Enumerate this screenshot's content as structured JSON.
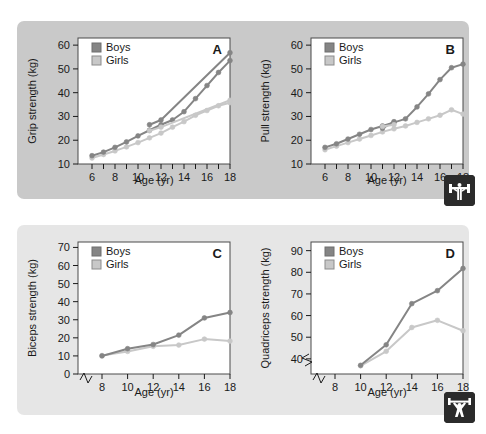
{
  "figure": {
    "name": "muscle-strength-by-age-and-sex",
    "background_top": "#c9c9c9",
    "background_bottom": "#e6e6e6",
    "series_colors": {
      "boys": "#858585",
      "girls": "#c8c8c8"
    }
  },
  "legend": {
    "boys_label": "Boys",
    "girls_label": "Girls"
  },
  "icons": {
    "pull_badge": "bench-press-icon",
    "lift_badge": "weightlifter-icon"
  },
  "chart_data": [
    {
      "id": "A",
      "type": "line",
      "panel_letter": "A",
      "title": "",
      "xlabel": "Age (yr)",
      "ylabel": "Grip strength (kg)",
      "xlim": [
        6,
        18
      ],
      "ylim": [
        10,
        63
      ],
      "yticks": [
        10,
        20,
        30,
        40,
        50,
        60
      ],
      "xticks": [
        6,
        7,
        8,
        9,
        10,
        11,
        12,
        13,
        14,
        15,
        16,
        17,
        18
      ],
      "xtick_labels": [
        "6",
        "",
        "8",
        "",
        "10",
        "",
        "12",
        "",
        "14",
        "",
        "16",
        "",
        "18"
      ],
      "axis_break_x": false,
      "grid": false,
      "legend_position": "top-left",
      "x": [
        6,
        7,
        8,
        9,
        10,
        11,
        12,
        13,
        14,
        15,
        16,
        17,
        18
      ],
      "series": [
        {
          "name": "Boys",
          "values": [
            13.5,
            15.0,
            17.0,
            19.3,
            21.8,
            24.2,
            26.5,
            28.5,
            32.0,
            37.5,
            43.0,
            48.5,
            53.5
          ]
        },
        {
          "name": "Girls",
          "values": [
            12.5,
            14.0,
            15.5,
            17.2,
            19.0,
            21.0,
            23.0,
            25.5,
            27.8,
            30.5,
            32.5,
            34.5,
            35.8
          ]
        }
      ],
      "series_extra": [
        {
          "name": "Boys",
          "values": [
            null,
            null,
            null,
            null,
            null,
            26.5,
            28.5,
            null,
            null,
            null,
            null,
            null,
            56.8
          ]
        },
        {
          "name": "Girls",
          "values": [
            null,
            null,
            null,
            null,
            null,
            24.0,
            25.5,
            null,
            null,
            null,
            null,
            null,
            36.8
          ]
        }
      ]
    },
    {
      "id": "B",
      "type": "line",
      "panel_letter": "B",
      "title": "",
      "xlabel": "Age (yr)",
      "ylabel": "Pull strength (kg)",
      "xlim": [
        6,
        18
      ],
      "ylim": [
        10,
        63
      ],
      "yticks": [
        10,
        20,
        30,
        40,
        50,
        60
      ],
      "xticks": [
        6,
        7,
        8,
        9,
        10,
        11,
        12,
        13,
        14,
        15,
        16,
        17,
        18
      ],
      "xtick_labels": [
        "6",
        "",
        "8",
        "",
        "10",
        "",
        "12",
        "",
        "14",
        "",
        "16",
        "",
        "18"
      ],
      "axis_break_x": false,
      "grid": false,
      "legend_position": "top-left",
      "x": [
        6,
        7,
        8,
        9,
        10,
        11,
        12,
        13,
        14,
        15,
        16,
        17,
        18
      ],
      "series": [
        {
          "name": "Boys",
          "values": [
            17.0,
            18.5,
            20.5,
            22.5,
            24.5,
            26.0,
            27.5,
            29.0,
            34.0,
            39.5,
            45.5,
            50.5,
            52.0
          ]
        },
        {
          "name": "Girls",
          "values": [
            16.0,
            17.5,
            19.0,
            20.5,
            22.0,
            23.5,
            24.8,
            26.0,
            27.5,
            29.0,
            30.5,
            32.8,
            31.0
          ]
        }
      ],
      "series_extra": [
        {
          "name": "Boys",
          "values": [
            null,
            null,
            null,
            null,
            null,
            25.0,
            27.8,
            null,
            null,
            null,
            null,
            null,
            null
          ]
        },
        {
          "name": "Girls",
          "values": [
            null,
            null,
            null,
            null,
            null,
            25.8,
            26.5,
            null,
            null,
            null,
            null,
            null,
            null
          ]
        }
      ]
    },
    {
      "id": "C",
      "type": "line",
      "panel_letter": "C",
      "title": "",
      "xlabel": "Age (yr)",
      "ylabel": "Biceps strength (kg)",
      "xlim": [
        8,
        18
      ],
      "ylim": [
        0,
        73
      ],
      "yticks": [
        0,
        10,
        20,
        30,
        40,
        50,
        60,
        70
      ],
      "xticks": [
        8,
        10,
        12,
        14,
        16,
        18
      ],
      "xtick_labels": [
        "8",
        "10",
        "12",
        "14",
        "16",
        "18"
      ],
      "axis_break_x": true,
      "grid": false,
      "legend_position": "top-left",
      "x": [
        8,
        10,
        12,
        14,
        16,
        18
      ],
      "series": [
        {
          "name": "Boys",
          "values": [
            10.0,
            14.0,
            16.3,
            21.5,
            31.0,
            34.0
          ]
        },
        {
          "name": "Girls",
          "values": [
            10.2,
            12.5,
            15.3,
            16.0,
            19.3,
            18.2
          ]
        }
      ]
    },
    {
      "id": "D",
      "type": "line",
      "panel_letter": "D",
      "title": "",
      "xlabel": "Age (yr)",
      "ylabel": "Quadriceps strength (kg)",
      "xlim": [
        8,
        18
      ],
      "ylim": [
        33,
        94
      ],
      "yticks": [
        40,
        50,
        60,
        70,
        80,
        90
      ],
      "xticks": [
        8,
        10,
        12,
        14,
        16,
        18
      ],
      "xtick_labels": [
        "8",
        "10",
        "12",
        "14",
        "16",
        "18"
      ],
      "axis_break_x": true,
      "axis_break_y": true,
      "grid": false,
      "legend_position": "top-left",
      "x": [
        10,
        12,
        14,
        16,
        18
      ],
      "series": [
        {
          "name": "Boys",
          "values": [
            37.0,
            46.5,
            65.5,
            71.5,
            81.8
          ]
        },
        {
          "name": "Girls",
          "values": [
            36.8,
            43.5,
            54.5,
            57.8,
            53.0
          ]
        }
      ]
    }
  ]
}
